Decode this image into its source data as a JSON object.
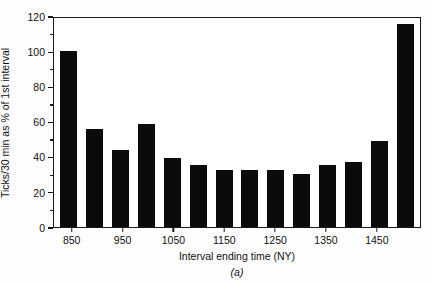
{
  "chart_data": {
    "type": "bar",
    "title": "",
    "xlabel": "Interval ending time (NY)",
    "ylabel": "Ticks/30 min as % of 1st interval",
    "panel_label": "(a)",
    "categories": [
      "850",
      "900",
      "950",
      "1000",
      "1050",
      "1100",
      "1150",
      "1200",
      "1250",
      "1300",
      "1350",
      "1400",
      "1450",
      "1500"
    ],
    "values": [
      100,
      56,
      44,
      58.5,
      39,
      35.5,
      32.5,
      32.5,
      32.5,
      30,
      35,
      37,
      49,
      115.5
    ],
    "xtick_labels": [
      "850",
      "950",
      "1050",
      "1150",
      "1250",
      "1350",
      "1450"
    ],
    "xtick_categories": [
      "850",
      "950",
      "1050",
      "1150",
      "1250",
      "1350",
      "1450"
    ],
    "ytick_labels": [
      "0",
      "20",
      "40",
      "60",
      "80",
      "100",
      "120"
    ],
    "ytick_values": [
      0,
      20,
      40,
      60,
      80,
      100,
      120
    ],
    "yminor_values": [
      10,
      30,
      50,
      70,
      90,
      110
    ],
    "ylim": [
      0,
      120
    ],
    "grid": false,
    "legend": null,
    "bar_color": "#0b0b0b",
    "axis_color": "#1a1a1a"
  }
}
